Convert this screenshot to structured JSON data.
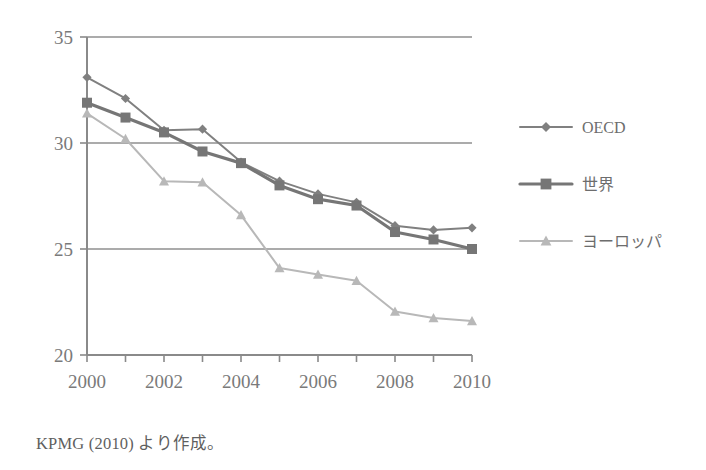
{
  "caption": "KPMG (2010) より作成。",
  "colors": {
    "oecd": "#808080",
    "world": "#767676",
    "europe": "#b8b8b8",
    "axis": "#8a8a8a",
    "grid": "#8f8f8f",
    "text": "#6f6f6f"
  },
  "axes": {
    "y_ticks": [
      "20",
      "25",
      "30",
      "35"
    ],
    "x_ticks": [
      "2000",
      "2002",
      "2004",
      "2006",
      "2008",
      "2010"
    ],
    "ylim_min": "20",
    "ylim_max": "35",
    "xlim_min": "2000",
    "xlim_max": "2010"
  },
  "legend": {
    "items": [
      {
        "label": "OECD",
        "marker": "diamond",
        "color": "#808080"
      },
      {
        "label": "世界",
        "marker": "square",
        "color": "#767676"
      },
      {
        "label": "ヨーロッパ",
        "marker": "triangle",
        "color": "#b8b8b8"
      }
    ]
  },
  "chart_data": {
    "type": "line",
    "title": "",
    "xlabel": "",
    "ylabel": "",
    "xlim": [
      2000,
      2010
    ],
    "ylim": [
      20,
      35
    ],
    "grid": true,
    "legend_position": "right",
    "x": [
      2000,
      2001,
      2002,
      2003,
      2004,
      2005,
      2006,
      2007,
      2008,
      2009,
      2010
    ],
    "categories": [
      "2000",
      "2001",
      "2002",
      "2003",
      "2004",
      "2005",
      "2006",
      "2007",
      "2008",
      "2009",
      "2010"
    ],
    "series": [
      {
        "name": "OECD",
        "marker": "diamond",
        "color": "#808080",
        "values": [
          33.1,
          32.1,
          30.6,
          30.65,
          29.1,
          28.2,
          27.6,
          27.2,
          26.1,
          25.9,
          26.0
        ]
      },
      {
        "name": "世界",
        "marker": "square",
        "color": "#767676",
        "values": [
          31.9,
          31.2,
          30.5,
          29.6,
          29.05,
          28.0,
          27.35,
          27.05,
          25.8,
          25.45,
          25.0
        ]
      },
      {
        "name": "ヨーロッパ",
        "marker": "triangle",
        "color": "#b8b8b8",
        "values": [
          31.4,
          30.2,
          28.2,
          28.15,
          26.6,
          24.1,
          23.8,
          23.5,
          22.05,
          21.75,
          21.6
        ]
      }
    ]
  }
}
